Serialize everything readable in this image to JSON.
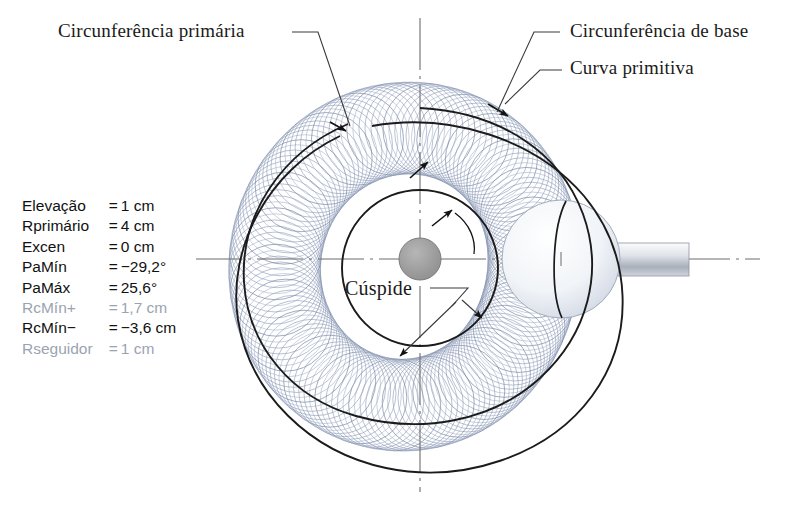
{
  "figure": {
    "type": "cam-profile-diagram",
    "callouts": {
      "primary_circle": "Circunferência primária",
      "base_circle": "Circunferência de base",
      "pitch_curve": "Curva primitiva",
      "cusp": "Cúspide"
    }
  },
  "parameters": {
    "rows": [
      {
        "label": "Elevação",
        "eq": "=",
        "value": "1 cm",
        "dim": false
      },
      {
        "label": "Rprimário",
        "eq": "=",
        "value": "4 cm",
        "dim": false
      },
      {
        "label": "Excen",
        "eq": "=",
        "value": "0 cm",
        "dim": false
      },
      {
        "label": "PaMín",
        "eq": "=",
        "value": "−29,2°",
        "dim": false
      },
      {
        "label": "PaMáx",
        "eq": "=",
        "value": "25,6°",
        "dim": false
      },
      {
        "label": "RcMín+",
        "eq": "=",
        "value": "1,7 cm",
        "dim": true
      },
      {
        "label": "RcMín−",
        "eq": "=",
        "value": "−3,6 cm",
        "dim": false
      },
      {
        "label": "Rseguidor",
        "eq": "=",
        "value": "1 cm",
        "dim": true
      }
    ]
  },
  "colors": {
    "mesh": "#7d8da9",
    "mesh_light": "#aab6cc",
    "outline": "#1b1b1b",
    "centerline": "#6d6d6d",
    "hub_fill": "#9a9a9a",
    "dim_text": "#9aa4b0",
    "text": "#111111",
    "roller_fill": "#eef1f6",
    "shaft_fill": "#b9bfc8"
  }
}
